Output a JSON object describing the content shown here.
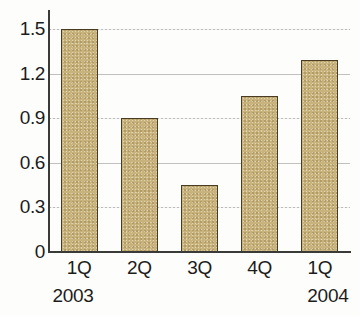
{
  "chart_data": {
    "type": "bar",
    "title": "",
    "subtitle": "",
    "xlabel": "",
    "ylabel": "",
    "categories": [
      "1Q",
      "2Q",
      "3Q",
      "4Q",
      "1Q"
    ],
    "group_labels": [
      "2003",
      "",
      "",
      "",
      "2004"
    ],
    "values": [
      1.5,
      0.9,
      0.45,
      1.05,
      1.29
    ],
    "ylim": [
      0,
      1.5
    ],
    "yticks": [
      "0",
      "0.3",
      "0.6",
      "0.9",
      "1.2",
      "1.5"
    ],
    "ytick_values": [
      0,
      0.3,
      0.6,
      0.9,
      1.2,
      1.5
    ],
    "grid": true,
    "grid_axis": "y",
    "legend": false,
    "legend_position": "none",
    "bar_color": "#c9b37c",
    "bar_border_color": "#4a3c22",
    "gridline_color": "#b9b9b9",
    "axis_color": "#3a3a38",
    "text_color": "#1c1c1c",
    "background": "#fdfdfb"
  }
}
